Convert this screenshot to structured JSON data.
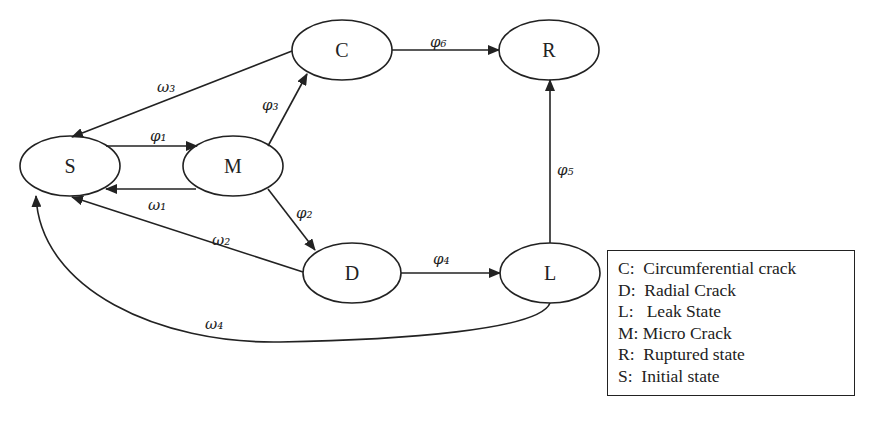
{
  "diagram": {
    "type": "state-transition",
    "nodes": [
      {
        "id": "S",
        "label": "S",
        "cx": 70,
        "cy": 166
      },
      {
        "id": "M",
        "label": "M",
        "cx": 233,
        "cy": 166
      },
      {
        "id": "C",
        "label": "C",
        "cx": 342,
        "cy": 50
      },
      {
        "id": "R",
        "label": "R",
        "cx": 549,
        "cy": 50
      },
      {
        "id": "D",
        "label": "D",
        "cx": 352,
        "cy": 273
      },
      {
        "id": "L",
        "label": "L",
        "cx": 550,
        "cy": 273
      }
    ],
    "edges": [
      {
        "from": "S",
        "to": "M",
        "label": "φ₁"
      },
      {
        "from": "M",
        "to": "S",
        "label": "ω₁"
      },
      {
        "from": "M",
        "to": "D",
        "label": "φ₂"
      },
      {
        "from": "M",
        "to": "C",
        "label": "φ₃"
      },
      {
        "from": "D",
        "to": "L",
        "label": "φ₄"
      },
      {
        "from": "L",
        "to": "R",
        "label": "φ₅"
      },
      {
        "from": "C",
        "to": "R",
        "label": "φ₆"
      },
      {
        "from": "D",
        "to": "S",
        "label": "ω₂"
      },
      {
        "from": "C",
        "to": "S",
        "label": "ω₃"
      },
      {
        "from": "L",
        "to": "S",
        "label": "ω₄"
      }
    ]
  },
  "labels": {
    "S": "S",
    "M": "M",
    "C": "C",
    "R": "R",
    "D": "D",
    "L": "L",
    "phi1": "φ₁",
    "phi2": "φ₂",
    "phi3": "φ₃",
    "phi4": "φ₄",
    "phi5": "φ₅",
    "phi6": "φ₆",
    "omega1": "ω₁",
    "omega2": "ω₂",
    "omega3": "ω₃",
    "omega4": "ω₄"
  },
  "legend": {
    "items": [
      "C:  Circumferential crack",
      "D:  Radial Crack",
      "L:   Leak State",
      "M: Micro Crack",
      "R:  Ruptured state",
      "S:  Initial state"
    ]
  },
  "colors": {
    "stroke": "#222222",
    "background": "#ffffff"
  }
}
